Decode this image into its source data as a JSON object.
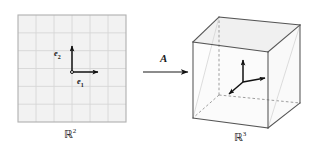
{
  "figure": {
    "background_color": "#ffffff",
    "width": 315,
    "height": 154
  },
  "domain_panel": {
    "name": "grid-square",
    "label": "R",
    "label_exponent": "2",
    "fill_color": "#f2f2f2",
    "border_color": "#b0b0b0",
    "grid_color": "#d6d6d6",
    "grid_divisions": 6,
    "x": 18,
    "y": 15,
    "width": 108,
    "height": 107,
    "origin": {
      "x": 72,
      "y": 72
    },
    "basis_vectors": [
      {
        "name": "e1",
        "label": "e",
        "subscript": "1",
        "dx": 26,
        "dy": 0,
        "label_x": 77,
        "label_y": 76
      },
      {
        "name": "e2",
        "label": "e",
        "subscript": "2",
        "dx": 0,
        "dy": -26,
        "label_x": 54,
        "label_y": 48
      }
    ]
  },
  "map_arrow": {
    "name": "transformation-arrow",
    "label": "A",
    "x1": 143,
    "y1": 72,
    "x2": 188,
    "y2": 72,
    "label_x": 160,
    "label_y": 52,
    "color": "#1a1a1a"
  },
  "codomain_panel": {
    "name": "cube",
    "label": "R",
    "label_exponent": "3",
    "edge_color": "#555555",
    "hidden_edge_color": "#8c8c8c",
    "face_fill": "#fbfbfb",
    "shade_fill": "#f0f0f0",
    "vertices": {
      "front_bottom_left": {
        "x": 193,
        "y": 118
      },
      "front_bottom_right": {
        "x": 268,
        "y": 128
      },
      "front_top_right": {
        "x": 268,
        "y": 52
      },
      "front_top_left": {
        "x": 193,
        "y": 42
      },
      "back_bottom_left": {
        "x": 219,
        "y": 95
      },
      "back_bottom_right": {
        "x": 300,
        "y": 103
      },
      "back_top_right": {
        "x": 300,
        "y": 25
      },
      "back_top_left": {
        "x": 219,
        "y": 17
      }
    },
    "basis_vectors": [
      {
        "name": "axis-up",
        "dx": 0,
        "dy": -22
      },
      {
        "name": "axis-right",
        "dx": 22,
        "dy": -4
      },
      {
        "name": "axis-diagonal-down-left",
        "dx": -14,
        "dy": 12
      }
    ],
    "origin": {
      "x": 243,
      "y": 82
    }
  }
}
